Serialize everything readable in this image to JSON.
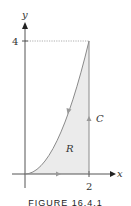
{
  "figure": {
    "axes": {
      "x_label": "x",
      "y_label": "y",
      "x_tick": "2",
      "y_tick": "4"
    },
    "curve": "y = x^2 from (0,0) to (2,4)",
    "region_label": "R",
    "boundary_label": "C",
    "orientation": "counterclockwise",
    "colors": {
      "axis": "#555555",
      "curve": "#8a8a8a",
      "fill": "#ebebeb",
      "arrow": "#999999",
      "text": "#333333"
    },
    "caption": "FIGURE 16.4.1"
  }
}
